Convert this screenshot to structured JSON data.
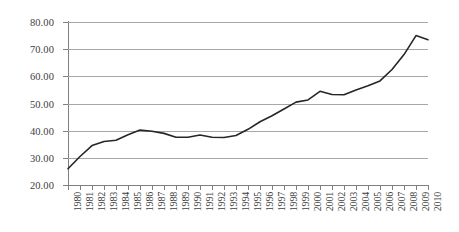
{
  "chart_data": {
    "type": "line",
    "title": "",
    "subtitle": "",
    "xlabel": "",
    "ylabel": "",
    "grid": true,
    "legend": false,
    "legend_position": "none",
    "xlim": [
      1980,
      2010
    ],
    "ylim": [
      20,
      80
    ],
    "ytick_step": 10,
    "yticks": [
      20,
      30,
      40,
      50,
      60,
      70,
      80
    ],
    "ytick_labels": [
      "20.00",
      "30.00",
      "40.00",
      "50.00",
      "60.00",
      "70.00",
      "80.00"
    ],
    "categories": [
      "1980",
      "1981",
      "1982",
      "1983",
      "1984",
      "1985",
      "1986",
      "1987",
      "1988",
      "1989",
      "1990",
      "1991",
      "1992",
      "1993",
      "1994",
      "1995",
      "1996",
      "1997",
      "1998",
      "1999",
      "2000",
      "2001",
      "2002",
      "2003",
      "2004",
      "2005",
      "2006",
      "2007",
      "2008",
      "2009",
      "2010"
    ],
    "x": [
      1980,
      1981,
      1982,
      1983,
      1984,
      1985,
      1986,
      1987,
      1988,
      1989,
      1990,
      1991,
      1992,
      1993,
      1994,
      1995,
      1996,
      1997,
      1998,
      1999,
      2000,
      2001,
      2002,
      2003,
      2004,
      2005,
      2006,
      2007,
      2008,
      2009,
      2010
    ],
    "series": [
      {
        "name": "series-1",
        "color": "#262626",
        "values": [
          26.0,
          30.5,
          34.5,
          36.0,
          36.5,
          38.5,
          40.2,
          39.8,
          39.0,
          37.6,
          37.6,
          38.4,
          37.6,
          37.5,
          38.2,
          40.5,
          43.3,
          45.5,
          48.0,
          50.5,
          51.3,
          54.5,
          53.3,
          53.2,
          55.0,
          56.5,
          58.3,
          62.5,
          68.0,
          75.0,
          73.5
        ]
      }
    ]
  },
  "style": {
    "line_color": "#262626",
    "grid_color": "#a6a6a6",
    "axis_color": "#7f7f7f",
    "label_color": "#404040",
    "background": "#ffffff"
  }
}
